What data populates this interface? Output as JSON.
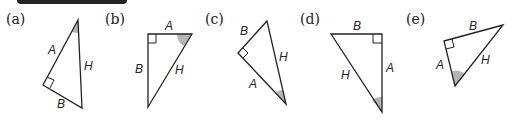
{
  "header_bar": {
    "color": "#222222"
  },
  "colors": {
    "stroke": "#222222",
    "shade": "#b5b5b5"
  },
  "panels": [
    {
      "label": "(a)",
      "sides": {
        "A": "A",
        "B": "B",
        "H": "H"
      }
    },
    {
      "label": "(b)",
      "sides": {
        "A": "A",
        "B": "B",
        "H": "H"
      }
    },
    {
      "label": "(c)",
      "sides": {
        "A": "A",
        "B": "B",
        "H": "H"
      }
    },
    {
      "label": "(d)",
      "sides": {
        "A": "A",
        "B": "B",
        "H": "H"
      }
    },
    {
      "label": "(e)",
      "sides": {
        "A": "A",
        "B": "B",
        "H": "H"
      }
    }
  ]
}
